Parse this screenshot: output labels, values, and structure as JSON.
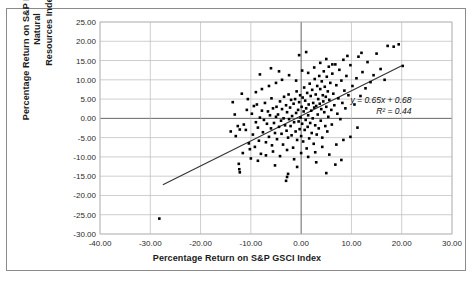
{
  "figure": {
    "background_color": "#ffffff",
    "frame_color": "#8a8a8a",
    "point_color": "#000000",
    "trendline_color": "#333333",
    "grid_color": "#b9b9b9",
    "zero_line_color": "#666666"
  },
  "chart_data": {
    "type": "scatter",
    "title": "",
    "xlabel": "Percentage Return on S&P GSCI Index",
    "ylabel": "Percentage Return on S&P North America Natural Resources Index",
    "ylabel_lines": [
      "Percentage Return on S&P North America Natural",
      "Resources Index"
    ],
    "xlim": [
      -40.0,
      30.0
    ],
    "ylim": [
      -30.0,
      25.0
    ],
    "xticks": [
      -40.0,
      -30.0,
      -20.0,
      -10.0,
      0.0,
      10.0,
      20.0,
      30.0
    ],
    "xtick_labels": [
      "-40.00",
      "-30.00",
      "-20.00",
      "-10.00",
      "0.00",
      "10.00",
      "20.00",
      "30.00"
    ],
    "yticks": [
      25.0,
      20.0,
      15.0,
      10.0,
      5.0,
      0.0,
      -5.0,
      -10.0,
      -15.0,
      -20.0,
      -25.0,
      -30.0
    ],
    "ytick_labels": [
      "25.00",
      "20.00",
      "15.00",
      "10.00",
      "5.00",
      "0.00",
      "-5.00",
      "-10.00",
      "-15.00",
      "-20.00",
      "-25.00",
      "-30.00"
    ],
    "grid": true,
    "grid_axis": "both",
    "legend": false,
    "annotations": [
      {
        "text": "y = 0.65x + 0.68",
        "x": 11.0,
        "y": 3.6
      },
      {
        "text": "R² = 0.44",
        "x": 11.0,
        "y": 1.4
      }
    ],
    "trendline": {
      "slope": 0.65,
      "intercept": 0.68,
      "r_squared": 0.44,
      "equation": "y = 0.65x + 0.68",
      "r2_label": "R² = 0.44",
      "x_start": -27.5,
      "x_end": 20.0
    },
    "marker": {
      "shape": "square",
      "size_px": 2.6,
      "color": "#000000"
    },
    "points": [
      [
        -28.2,
        -26.0
      ],
      [
        -12.6,
        -2.0
      ],
      [
        -12.2,
        -2.9
      ],
      [
        -12.4,
        -11.8
      ],
      [
        -12.3,
        -13.2
      ],
      [
        -12.2,
        -14.0
      ],
      [
        -11.4,
        -1.6
      ],
      [
        -11.0,
        -3.0
      ],
      [
        -10.8,
        2.2
      ],
      [
        -10.4,
        -6.5
      ],
      [
        -10.2,
        -8.0
      ],
      [
        -9.8,
        1.2
      ],
      [
        -9.6,
        -4.2
      ],
      [
        -9.4,
        3.2
      ],
      [
        -9.2,
        -7.4
      ],
      [
        -9.0,
        -1.0
      ],
      [
        -8.8,
        3.6
      ],
      [
        -8.6,
        -2.4
      ],
      [
        -8.4,
        -5.8
      ],
      [
        -8.2,
        0.2
      ],
      [
        -8.0,
        -9.2
      ],
      [
        -7.8,
        2.0
      ],
      [
        -7.6,
        -3.6
      ],
      [
        -7.4,
        -0.4
      ],
      [
        -7.2,
        4.0
      ],
      [
        -7.0,
        -6.2
      ],
      [
        -6.8,
        -1.4
      ],
      [
        -6.6,
        1.8
      ],
      [
        -6.4,
        -4.8
      ],
      [
        -6.2,
        0.8
      ],
      [
        -6.0,
        -2.6
      ],
      [
        -5.9,
        5.2
      ],
      [
        -5.8,
        -7.0
      ],
      [
        -5.6,
        2.6
      ],
      [
        -5.4,
        -1.2
      ],
      [
        -5.2,
        -3.8
      ],
      [
        -5.0,
        0.4
      ],
      [
        -4.9,
        3.0
      ],
      [
        -4.8,
        -5.4
      ],
      [
        -4.6,
        1.0
      ],
      [
        -4.4,
        -2.2
      ],
      [
        -4.2,
        4.4
      ],
      [
        -4.0,
        -0.6
      ],
      [
        -3.9,
        -4.0
      ],
      [
        -3.8,
        2.4
      ],
      [
        -3.6,
        -6.8
      ],
      [
        -3.5,
        0.0
      ],
      [
        -3.4,
        5.6
      ],
      [
        -3.2,
        -1.8
      ],
      [
        -3.0,
        3.4
      ],
      [
        -2.9,
        -3.2
      ],
      [
        -2.8,
        1.6
      ],
      [
        -2.6,
        -5.0
      ],
      [
        -2.5,
        6.2
      ],
      [
        -2.4,
        -0.2
      ],
      [
        -2.2,
        2.8
      ],
      [
        -2.1,
        -2.0
      ],
      [
        -2.0,
        4.8
      ],
      [
        -1.9,
        -4.4
      ],
      [
        -1.8,
        0.6
      ],
      [
        -1.6,
        -7.6
      ],
      [
        -1.5,
        3.8
      ],
      [
        -1.4,
        -1.0
      ],
      [
        -1.2,
        5.0
      ],
      [
        -1.1,
        -3.4
      ],
      [
        -1.0,
        1.4
      ],
      [
        -0.9,
        7.0
      ],
      [
        -0.8,
        -5.6
      ],
      [
        -0.6,
        2.2
      ],
      [
        -0.5,
        -0.8
      ],
      [
        -0.4,
        4.2
      ],
      [
        -0.3,
        -2.8
      ],
      [
        -0.2,
        6.0
      ],
      [
        -0.1,
        0.2
      ],
      [
        0.0,
        -4.6
      ],
      [
        0.1,
        3.0
      ],
      [
        0.2,
        -1.4
      ],
      [
        0.3,
        5.4
      ],
      [
        0.4,
        -6.0
      ],
      [
        0.5,
        1.8
      ],
      [
        0.6,
        8.0
      ],
      [
        0.7,
        -3.0
      ],
      [
        0.8,
        4.6
      ],
      [
        0.9,
        -0.4
      ],
      [
        1.0,
        2.6
      ],
      [
        1.1,
        -7.8
      ],
      [
        1.2,
        6.6
      ],
      [
        1.3,
        -2.2
      ],
      [
        1.4,
        0.8
      ],
      [
        1.5,
        3.6
      ],
      [
        1.6,
        -5.2
      ],
      [
        1.7,
        9.0
      ],
      [
        1.8,
        -1.2
      ],
      [
        1.9,
        5.8
      ],
      [
        2.0,
        2.0
      ],
      [
        2.1,
        -3.8
      ],
      [
        2.2,
        7.4
      ],
      [
        2.3,
        0.0
      ],
      [
        2.4,
        4.0
      ],
      [
        2.5,
        -6.6
      ],
      [
        2.6,
        2.8
      ],
      [
        2.7,
        10.2
      ],
      [
        2.8,
        -1.8
      ],
      [
        2.9,
        6.2
      ],
      [
        3.0,
        3.2
      ],
      [
        3.1,
        -4.2
      ],
      [
        3.2,
        8.4
      ],
      [
        3.3,
        1.0
      ],
      [
        3.4,
        5.0
      ],
      [
        3.5,
        -2.6
      ],
      [
        3.6,
        11.0
      ],
      [
        3.7,
        3.8
      ],
      [
        3.8,
        7.6
      ],
      [
        3.9,
        -0.6
      ],
      [
        4.0,
        2.4
      ],
      [
        4.1,
        9.6
      ],
      [
        4.2,
        -5.0
      ],
      [
        4.3,
        6.0
      ],
      [
        4.4,
        4.4
      ],
      [
        4.5,
        12.2
      ],
      [
        4.6,
        1.6
      ],
      [
        4.7,
        8.2
      ],
      [
        4.8,
        -2.0
      ],
      [
        4.9,
        5.6
      ],
      [
        5.0,
        3.0
      ],
      [
        5.1,
        10.8
      ],
      [
        5.2,
        -3.4
      ],
      [
        5.3,
        7.0
      ],
      [
        5.4,
        0.4
      ],
      [
        5.5,
        13.4
      ],
      [
        5.6,
        4.8
      ],
      [
        5.8,
        9.2
      ],
      [
        6.0,
        2.2
      ],
      [
        6.1,
        -1.6
      ],
      [
        6.2,
        11.6
      ],
      [
        6.4,
        6.4
      ],
      [
        6.6,
        3.4
      ],
      [
        6.8,
        14.0
      ],
      [
        7.0,
        8.6
      ],
      [
        7.2,
        1.2
      ],
      [
        7.4,
        5.2
      ],
      [
        7.6,
        12.6
      ],
      [
        7.8,
        -0.2
      ],
      [
        8.0,
        9.8
      ],
      [
        8.2,
        4.0
      ],
      [
        8.4,
        15.2
      ],
      [
        8.6,
        7.2
      ],
      [
        8.8,
        2.6
      ],
      [
        9.0,
        11.0
      ],
      [
        9.4,
        6.0
      ],
      [
        9.8,
        13.8
      ],
      [
        10.2,
        8.4
      ],
      [
        10.6,
        3.6
      ],
      [
        11.0,
        10.4
      ],
      [
        11.4,
        16.0
      ],
      [
        11.8,
        5.8
      ],
      [
        12.2,
        12.0
      ],
      [
        12.8,
        7.8
      ],
      [
        13.2,
        14.6
      ],
      [
        13.8,
        9.4
      ],
      [
        14.4,
        11.2
      ],
      [
        15.0,
        16.8
      ],
      [
        15.8,
        12.8
      ],
      [
        16.6,
        10.0
      ],
      [
        17.2,
        18.8
      ],
      [
        18.4,
        18.6
      ],
      [
        19.4,
        19.2
      ],
      [
        20.2,
        13.6
      ],
      [
        -11.8,
        6.4
      ],
      [
        -10.6,
        5.0
      ],
      [
        -9.0,
        6.8
      ],
      [
        -7.8,
        7.6
      ],
      [
        -6.4,
        8.4
      ],
      [
        -5.0,
        9.2
      ],
      [
        -3.8,
        10.0
      ],
      [
        -2.4,
        11.2
      ],
      [
        -1.0,
        9.8
      ],
      [
        0.2,
        12.4
      ],
      [
        1.4,
        11.8
      ],
      [
        2.6,
        13.2
      ],
      [
        3.8,
        14.4
      ],
      [
        5.0,
        15.4
      ],
      [
        6.2,
        14.0
      ],
      [
        -13.0,
        -4.6
      ],
      [
        -11.6,
        -9.0
      ],
      [
        -10.0,
        -10.4
      ],
      [
        -8.6,
        -11.0
      ],
      [
        -7.0,
        -9.6
      ],
      [
        -5.6,
        -8.6
      ],
      [
        -4.2,
        -9.8
      ],
      [
        -2.8,
        -8.2
      ],
      [
        -1.4,
        -10.6
      ],
      [
        0.0,
        -9.0
      ],
      [
        1.4,
        -10.0
      ],
      [
        2.8,
        -8.8
      ],
      [
        4.2,
        -7.4
      ],
      [
        5.6,
        -9.4
      ],
      [
        7.0,
        -6.8
      ],
      [
        8.4,
        -5.6
      ],
      [
        9.8,
        -4.8
      ],
      [
        11.2,
        -2.4
      ],
      [
        -3.0,
        -16.2
      ],
      [
        -2.6,
        -14.4
      ],
      [
        -2.8,
        -15.2
      ],
      [
        5.0,
        -14.2
      ],
      [
        -0.4,
        16.4
      ],
      [
        1.0,
        17.2
      ],
      [
        -6.0,
        13.0
      ],
      [
        -4.4,
        12.2
      ],
      [
        -8.2,
        11.4
      ],
      [
        12.0,
        17.0
      ],
      [
        9.2,
        16.2
      ],
      [
        -13.2,
        1.0
      ],
      [
        -14.0,
        -3.4
      ],
      [
        -13.6,
        4.2
      ],
      [
        6.8,
        -12.0
      ],
      [
        -0.8,
        -12.6
      ],
      [
        3.0,
        -11.4
      ],
      [
        -5.2,
        -12.2
      ],
      [
        8.0,
        -10.8
      ]
    ]
  }
}
